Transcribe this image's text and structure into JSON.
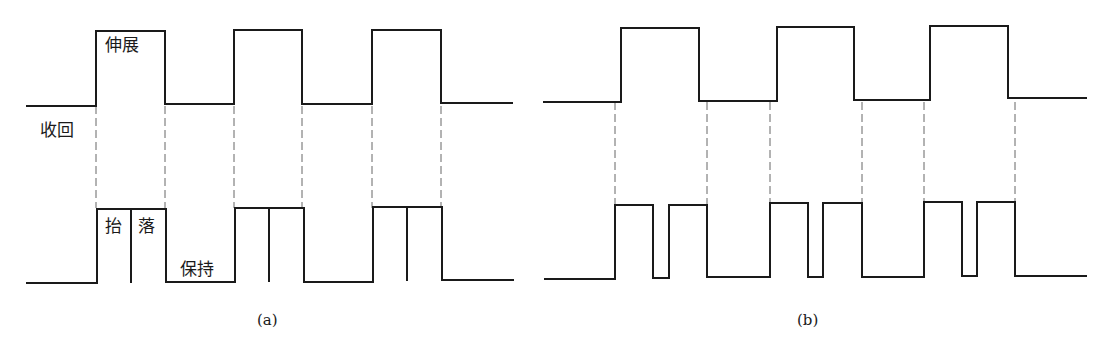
{
  "figure": {
    "panel_a": {
      "caption": "(a)",
      "labels": {
        "extend": "伸展",
        "retract": "收回",
        "lift": "抬",
        "drop": "落",
        "hold": "保持"
      },
      "upper_wave": {
        "description": "cylinder extend/retract square wave",
        "points": [
          [
            27,
            106
          ],
          [
            96,
            106
          ],
          [
            96,
            31
          ],
          [
            165,
            31
          ],
          [
            165,
            104
          ],
          [
            234,
            104
          ],
          [
            234,
            30
          ],
          [
            302,
            30
          ],
          [
            302,
            104
          ],
          [
            372,
            104
          ],
          [
            372,
            30
          ],
          [
            441,
            30
          ],
          [
            441,
            103
          ],
          [
            512,
            103
          ]
        ]
      },
      "lower_wave": {
        "description": "lift/drop/hold square wave",
        "points": [
          [
            27,
            283
          ],
          [
            97,
            283
          ],
          [
            97,
            209
          ],
          [
            166,
            209
          ],
          [
            166,
            282
          ],
          [
            235,
            282
          ],
          [
            235,
            208
          ],
          [
            304,
            208
          ],
          [
            304,
            282
          ],
          [
            373,
            282
          ],
          [
            373,
            207
          ],
          [
            442,
            207
          ],
          [
            442,
            280
          ],
          [
            513,
            280
          ]
        ]
      },
      "dividers": [
        [
          131,
          209,
          283
        ],
        [
          269,
          208,
          282
        ],
        [
          407,
          207,
          281
        ]
      ],
      "dashed_x": [
        96,
        165,
        234,
        302,
        372,
        441
      ],
      "dashed_y": [
        106,
        208
      ]
    },
    "panel_b": {
      "caption": "(b)",
      "upper_wave": {
        "points": [
          [
            544,
            102
          ],
          [
            621,
            102
          ],
          [
            621,
            28
          ],
          [
            699,
            28
          ],
          [
            699,
            101
          ],
          [
            777,
            101
          ],
          [
            777,
            27
          ],
          [
            854,
            27
          ],
          [
            854,
            100
          ],
          [
            930,
            100
          ],
          [
            930,
            26
          ],
          [
            1008,
            26
          ],
          [
            1008,
            98
          ],
          [
            1086,
            98
          ]
        ]
      },
      "lower_wave": {
        "points": [
          [
            545,
            279
          ],
          [
            615,
            279
          ],
          [
            615,
            205
          ],
          [
            653,
            205
          ],
          [
            653,
            278
          ],
          [
            669,
            278
          ],
          [
            669,
            205
          ],
          [
            707,
            205
          ],
          [
            707,
            277
          ],
          [
            770,
            277
          ],
          [
            770,
            203
          ],
          [
            808,
            203
          ],
          [
            808,
            277
          ],
          [
            823,
            277
          ],
          [
            823,
            203
          ],
          [
            862,
            203
          ],
          [
            862,
            277
          ],
          [
            924,
            277
          ],
          [
            924,
            202
          ],
          [
            962,
            202
          ],
          [
            962,
            276
          ],
          [
            977,
            276
          ],
          [
            977,
            202
          ],
          [
            1015,
            202
          ],
          [
            1015,
            276
          ],
          [
            1086,
            276
          ]
        ]
      },
      "dashed_x": [
        615,
        707,
        770,
        862,
        924,
        1015
      ],
      "dashed_y": [
        102,
        204
      ]
    },
    "colors": {
      "line": "#1a1a1a",
      "dash": "#666666",
      "background": "#ffffff"
    }
  }
}
